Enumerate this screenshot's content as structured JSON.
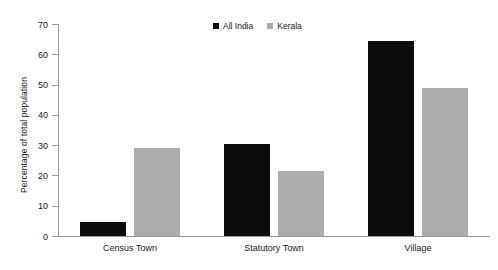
{
  "chart_data": {
    "type": "bar",
    "title": "",
    "subtitle": "",
    "xlabel": "",
    "ylabel": "Percentage of total population",
    "categories": [
      "Census Town",
      "Statutory Town",
      "Village"
    ],
    "series": [
      {
        "name": "All India",
        "color": "#0d0d0d",
        "values": [
          4.5,
          30.5,
          64.3
        ]
      },
      {
        "name": "Kerala",
        "color": "#adadad",
        "values": [
          29.0,
          21.5,
          48.8
        ]
      }
    ],
    "ylim": [
      0,
      70
    ],
    "ytick_step": 10,
    "yticks": [
      0,
      10,
      20,
      30,
      40,
      50,
      60,
      70
    ],
    "ytick_labels": [
      "0",
      "10",
      "20",
      "30",
      "40",
      "50",
      "60",
      "70"
    ],
    "grid": false,
    "legend_position": "top-center",
    "axis_color": "#9a9a9a",
    "background": "#ffffff"
  }
}
